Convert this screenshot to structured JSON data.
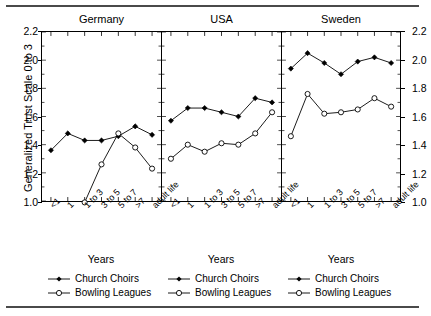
{
  "figure": {
    "y_axis_title": "Generalized Trust Scale 0 to 3",
    "x_axis_title": "Years"
  },
  "chart_data": {
    "type": "line",
    "title": "",
    "xlabel": "Years",
    "ylabel": "Generalized Trust Scale 0 to 3",
    "ylim": [
      1.0,
      2.2
    ],
    "yticks": [
      "1.0",
      "1.2",
      "1.4",
      "1.6",
      "1.8",
      "2.0",
      "2.2"
    ],
    "ytick_values": [
      1.0,
      1.2,
      1.4,
      1.6,
      1.8,
      2.0,
      2.2
    ],
    "grid": false,
    "legend_position": "bottom",
    "categories": [
      "<1",
      "1",
      "1 to 3",
      "3 to 5",
      "5 to 7",
      ">7",
      "adult life"
    ],
    "panels": [
      {
        "name": "Germany",
        "series": [
          {
            "name": "Church Choirs",
            "marker": "filled-diamond",
            "values": [
              1.36,
              1.48,
              1.43,
              1.43,
              1.46,
              1.53,
              1.47
            ]
          },
          {
            "name": "Bowling Leagues",
            "marker": "open-circle",
            "values": [
              null,
              null,
              0.99,
              1.26,
              1.48,
              1.38,
              1.23
            ]
          }
        ]
      },
      {
        "name": "USA",
        "series": [
          {
            "name": "Church Choirs",
            "marker": "filled-diamond",
            "values": [
              1.57,
              1.66,
              1.66,
              1.63,
              1.6,
              1.73,
              1.7
            ]
          },
          {
            "name": "Bowling Leagues",
            "marker": "open-circle",
            "values": [
              1.3,
              1.4,
              1.35,
              1.41,
              1.4,
              1.48,
              1.63
            ]
          }
        ]
      },
      {
        "name": "Sweden",
        "series": [
          {
            "name": "Church Choirs",
            "marker": "filled-diamond",
            "values": [
              1.94,
              2.05,
              1.98,
              1.9,
              1.99,
              2.02,
              1.98
            ]
          },
          {
            "name": "Bowling Leagues",
            "marker": "open-circle",
            "values": [
              1.46,
              1.76,
              1.62,
              1.63,
              1.65,
              1.73,
              1.67
            ]
          }
        ]
      }
    ],
    "colors": {
      "line": "#000000",
      "marker_fill_choirs": "#000000",
      "marker_fill_bowling": "#ffffff",
      "axis": "#000000",
      "rule": "#4a4a4a"
    }
  }
}
